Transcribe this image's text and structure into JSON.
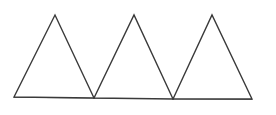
{
  "diagram": {
    "stroke_color": "#3a3a3a",
    "stroke_width": 1.4,
    "fill_color": "#ffffff",
    "baseline": {
      "x1": 14,
      "y1": 97,
      "x2": 252,
      "y2": 99
    },
    "triangles": [
      {
        "label": "triangle-1",
        "points": [
          [
            14,
            97
          ],
          [
            55,
            15
          ],
          [
            94,
            98
          ]
        ]
      },
      {
        "label": "triangle-2",
        "points": [
          [
            94,
            98
          ],
          [
            134,
            15
          ],
          [
            173,
            99
          ]
        ]
      },
      {
        "label": "triangle-3",
        "points": [
          [
            173,
            99
          ],
          [
            212,
            15
          ],
          [
            252,
            99
          ]
        ]
      }
    ]
  }
}
